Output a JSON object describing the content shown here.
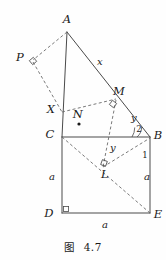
{
  "figure": {
    "caption_label": "图",
    "caption_number": "4.7",
    "stroke_color": "#4a4a4a",
    "dash_color": "#6b6b6b",
    "text_color": "#1a1a1a",
    "background": "#fefefe"
  },
  "points": [
    {
      "name": "A",
      "label": "A",
      "x": 67,
      "y": 30,
      "lx": 67,
      "ly": 20
    },
    {
      "name": "P",
      "label": "P",
      "x": 33,
      "y": 61,
      "lx": 20,
      "ly": 58
    },
    {
      "name": "X",
      "label": "X",
      "x": 62,
      "y": 111,
      "lx": 51,
      "ly": 110
    },
    {
      "name": "C",
      "label": "C",
      "x": 62,
      "y": 137,
      "lx": 50,
      "ly": 135
    },
    {
      "name": "N",
      "label": "N",
      "x": 79,
      "y": 124,
      "lx": 78,
      "ly": 115
    },
    {
      "name": "M",
      "label": "M",
      "x": 115,
      "y": 100,
      "lx": 119,
      "ly": 92
    },
    {
      "name": "B",
      "label": "B",
      "x": 150,
      "y": 137,
      "lx": 158,
      "ly": 136
    },
    {
      "name": "L",
      "label": "L",
      "x": 105,
      "y": 165,
      "lx": 105,
      "ly": 175
    },
    {
      "name": "D",
      "label": "D",
      "x": 62,
      "y": 213,
      "lx": 49,
      "ly": 214
    },
    {
      "name": "E",
      "label": "E",
      "x": 150,
      "y": 213,
      "lx": 158,
      "ly": 215
    }
  ],
  "length_labels": [
    {
      "name": "segment-x-label",
      "text": "x",
      "lx": 100,
      "ly": 62
    },
    {
      "name": "segment-y-upper-label",
      "text": "y",
      "lx": 134,
      "ly": 118
    },
    {
      "name": "segment-y-lower-label",
      "text": "y",
      "lx": 113,
      "ly": 148
    },
    {
      "name": "side-a-left-label",
      "text": "a",
      "lx": 52,
      "ly": 177
    },
    {
      "name": "side-a-right-label",
      "text": "a",
      "lx": 147,
      "ly": 177
    },
    {
      "name": "side-a-bottom-label",
      "text": "a",
      "lx": 105,
      "ly": 225
    }
  ],
  "angle_labels": [
    {
      "name": "angle-2-label",
      "text": "2",
      "lx": 139,
      "ly": 129
    },
    {
      "name": "angle-1-label",
      "text": "1",
      "lx": 145,
      "ly": 155
    }
  ],
  "solid_segments": [
    {
      "name": "segment-A-C",
      "x1": 67,
      "y1": 32,
      "x2": 62,
      "y2": 137
    },
    {
      "name": "segment-A-B",
      "x1": 67,
      "y1": 32,
      "x2": 150,
      "y2": 137
    },
    {
      "name": "segment-C-B",
      "x1": 62,
      "y1": 137,
      "x2": 150,
      "y2": 137
    },
    {
      "name": "segment-C-D",
      "x1": 62,
      "y1": 137,
      "x2": 62,
      "y2": 213
    },
    {
      "name": "segment-D-E",
      "x1": 62,
      "y1": 213,
      "x2": 150,
      "y2": 213
    },
    {
      "name": "segment-E-B",
      "x1": 150,
      "y1": 213,
      "x2": 150,
      "y2": 137
    }
  ],
  "dashed_segments": [
    {
      "name": "segment-A-P",
      "x1": 67,
      "y1": 32,
      "x2": 33,
      "y2": 60
    },
    {
      "name": "segment-P-X",
      "x1": 33,
      "y1": 62,
      "x2": 62,
      "y2": 112
    },
    {
      "name": "segment-X-M",
      "x1": 62,
      "y1": 112,
      "x2": 116,
      "y2": 99
    },
    {
      "name": "segment-C-E",
      "x1": 62,
      "y1": 137,
      "x2": 150,
      "y2": 213
    },
    {
      "name": "segment-M-L",
      "x1": 116,
      "y1": 100,
      "x2": 103,
      "y2": 167
    },
    {
      "name": "segment-L-B",
      "x1": 103,
      "y1": 167,
      "x2": 150,
      "y2": 138
    }
  ],
  "right_angle_marks": [
    {
      "name": "right-angle-at-P",
      "cx": 33,
      "cy": 61,
      "rot": -40
    },
    {
      "name": "right-angle-at-M",
      "cx": 113,
      "cy": 104,
      "rot": 38
    },
    {
      "name": "right-angle-at-L",
      "cx": 104,
      "cy": 163,
      "rot": 20
    },
    {
      "name": "right-angle-at-D",
      "cx": 66,
      "cy": 209,
      "rot": 0
    }
  ],
  "angle_arcs": [
    {
      "name": "angle-arc-2",
      "cx": 150,
      "cy": 137,
      "r": 13,
      "a1": 180,
      "a2": 230
    },
    {
      "name": "angle-arc-1",
      "cx": 150,
      "cy": 137,
      "r": 18,
      "a1": 180,
      "a2": 212
    }
  ],
  "marker_dot": {
    "name": "point-N-dot",
    "cx": 79,
    "cy": 124,
    "r": 1.6
  }
}
